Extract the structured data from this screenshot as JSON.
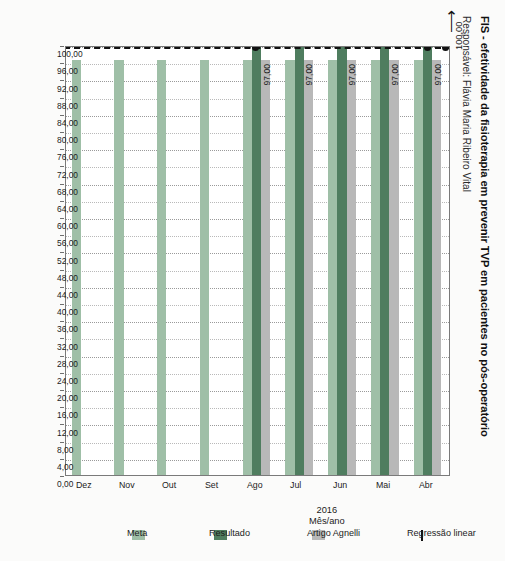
{
  "header": {
    "title": "FIS - efetividade da fisioterapia em prevenir TVP em pacientes no pós-operatório",
    "subtitle": "Responsável: Flávia Maria Ribeiro Vital"
  },
  "axis_title": {
    "year": "2016",
    "label": "Mês/ano"
  },
  "annotation": {
    "regression_endpoint_value": "100,00",
    "arrow_icon": "left-arrow-icon"
  },
  "legend": {
    "position": "right",
    "items": [
      {
        "label": "Meta",
        "color": "#9fbfa7",
        "marker": "swatch"
      },
      {
        "label": "Resultado",
        "color": "#4f7d5f",
        "marker": "swatch"
      },
      {
        "label": "Artigo Agnelli",
        "color": "#b8b8b8",
        "marker": "swatch"
      },
      {
        "label": "Regressão linear",
        "color": "#111111",
        "marker": "dashed-line"
      }
    ]
  },
  "chart_data": {
    "type": "bar",
    "orientation": "horizontal",
    "title": "FIS - efetividade da fisioterapia em prevenir TVP em pacientes no pós-operatório",
    "subtitle": "Responsável: Flávia Maria Ribeiro Vital",
    "xlabel": "",
    "ylabel": "2016 Mês/ano",
    "xlim": [
      0,
      100
    ],
    "grid": true,
    "categories": [
      "Abr",
      "Mai",
      "Jun",
      "Jul",
      "Ago",
      "Set",
      "Out",
      "Nov",
      "Dez"
    ],
    "tick_labels": [
      "100,00",
      "96,00",
      "92,00",
      "88,00",
      "84,00",
      "80,00",
      "76,00",
      "72,00",
      "68,00",
      "64,00",
      "60,00",
      "56,00",
      "52,00",
      "48,00",
      "44,00",
      "40,00",
      "36,00",
      "32,00",
      "28,00",
      "24,00",
      "20,00",
      "16,00",
      "12,00",
      "8,00",
      "4,00",
      "0,00"
    ],
    "tick_values": [
      100,
      96,
      92,
      88,
      84,
      80,
      76,
      72,
      68,
      64,
      60,
      56,
      52,
      48,
      44,
      40,
      36,
      32,
      28,
      24,
      20,
      16,
      12,
      8,
      4,
      0
    ],
    "series": [
      {
        "name": "Artigo Agnelli",
        "color": "#b8b8b8",
        "values": [
          97,
          97,
          97,
          97,
          97,
          null,
          null,
          null,
          null
        ],
        "labels": [
          "97,00",
          "97,00",
          "97,00",
          "97,00",
          "97,00",
          "",
          "",
          "",
          ""
        ]
      },
      {
        "name": "Resultado",
        "color": "#4f7d5f",
        "values": [
          100,
          100,
          100,
          100,
          100,
          null,
          null,
          null,
          null
        ],
        "labels": [
          "100,00",
          "100,00",
          "100,00",
          "100,00",
          "100,00",
          "",
          "",
          "",
          ""
        ]
      },
      {
        "name": "Meta",
        "color": "#9fbfa7",
        "values": [
          97,
          97,
          97,
          97,
          97,
          97,
          97,
          97,
          97
        ],
        "labels": [
          "97,00",
          "97,00",
          "97,00",
          "97,00",
          "97,00",
          "97,00",
          "97,00",
          "97,00",
          "97,00"
        ]
      }
    ],
    "regression": {
      "name": "Regressão linear",
      "style": "dashed",
      "color": "#111111",
      "value": 100,
      "endpoint_label": "100,00"
    }
  }
}
